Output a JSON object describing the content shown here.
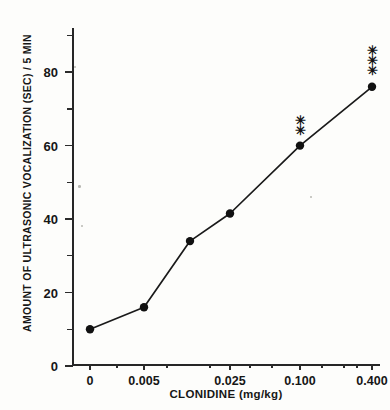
{
  "chart_data": {
    "type": "line",
    "title": "",
    "xlabel": "CLONIDINE (mg/kg)",
    "ylabel": "AMOUNT OF ULTRASONIC VOCALIZATION (SEC) / 5 MIN",
    "categories": [
      "0",
      "0.005",
      "",
      "0.025",
      "0.100",
      "0.400"
    ],
    "x_tick_labels": [
      "0",
      "0.005",
      "0.025",
      "0.100",
      "0.400"
    ],
    "y_tick_labels": [
      "0",
      "20",
      "40",
      "60",
      "80"
    ],
    "y_major_ticks": [
      0,
      20,
      40,
      60,
      80
    ],
    "y_minor_ticks": [
      10,
      30,
      50,
      70,
      90
    ],
    "values": [
      10,
      16,
      34,
      41.5,
      60,
      76
    ],
    "ylim": [
      0,
      92
    ],
    "grid": false,
    "legend": false,
    "marker": "filled-circle",
    "line_color": "#1a1a1a",
    "marker_color": "#111111",
    "annotations": [
      {
        "at_category": "0.100",
        "text": "**",
        "meaning": "significance-marker"
      },
      {
        "at_category": "0.400",
        "text": "***",
        "meaning": "significance-marker"
      }
    ],
    "points": [
      {
        "x_label": "0",
        "y": 10,
        "significance": ""
      },
      {
        "x_label": "0.005",
        "y": 16,
        "significance": ""
      },
      {
        "x_label": "",
        "y": 34,
        "significance": ""
      },
      {
        "x_label": "0.025",
        "y": 41.5,
        "significance": ""
      },
      {
        "x_label": "0.100",
        "y": 60,
        "significance": "**"
      },
      {
        "x_label": "0.400",
        "y": 76,
        "significance": "***"
      }
    ]
  }
}
